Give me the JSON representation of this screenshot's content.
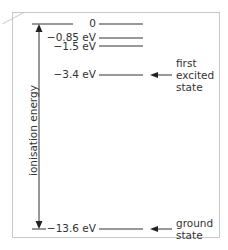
{
  "diagram": {
    "axis_label": "ionisation energy",
    "levels": [
      {
        "label": "0",
        "value_ev": 0
      },
      {
        "label": "−0.85 eV",
        "value_ev": -0.85
      },
      {
        "label": "−1.5 eV",
        "value_ev": -1.5
      },
      {
        "label": "−3.4 eV",
        "value_ev": -3.4
      },
      {
        "label": "−13.6 eV",
        "value_ev": -13.6
      }
    ],
    "annotations": {
      "first_excited": {
        "line1": "first",
        "line2": "excited",
        "line3": "state",
        "points_to": "−3.4 eV"
      },
      "ground": {
        "line1": "ground",
        "line2": "state",
        "points_to": "−13.6 eV"
      }
    },
    "colors": {
      "ink": "#333333",
      "frame": "#c8c8c8"
    }
  }
}
